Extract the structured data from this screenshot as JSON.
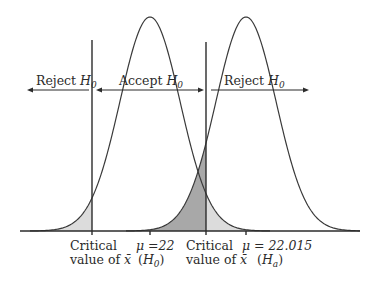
{
  "figure": {
    "regions": {
      "left_reject": {
        "label": "Reject ",
        "sub": "0",
        "var": "H"
      },
      "accept": {
        "label": "Accept ",
        "sub": "0",
        "var": "H"
      },
      "right_reject": {
        "label": "Reject ",
        "sub": "0",
        "var": "H"
      }
    },
    "axis_labels": {
      "crit_left_line1": "Critical",
      "crit_left_line2": "value of ",
      "crit_left_symbol": "x̄",
      "mu0_line1": "μ =22",
      "mu0_line2_open": "(",
      "mu0_line2_var": "H",
      "mu0_line2_sub": "0",
      "mu0_line2_close": ")",
      "crit_right_line1": "Critical",
      "crit_right_line2": "value of ",
      "crit_right_symbol": "x̄",
      "mua_line1": "μ = 22.015",
      "mua_line2_open": "(",
      "mua_line2_var": "H",
      "mua_line2_sub": "a",
      "mua_line2_close": ")"
    },
    "colors": {
      "alpha_shade": "#dcdcdc",
      "beta_shade": "#a8a8a8",
      "ink": "#2b2b2b"
    },
    "geometry": {
      "baseline_y": 231,
      "baseline_x0": 20,
      "baseline_x1": 360,
      "peak_height": 214,
      "sigma_px": 30,
      "h0_center_x": 150,
      "ha_center_x": 246,
      "crit_left_x": 92,
      "crit_right_x": 206,
      "crit_top_y": 40,
      "arrow_y": 90
    }
  }
}
